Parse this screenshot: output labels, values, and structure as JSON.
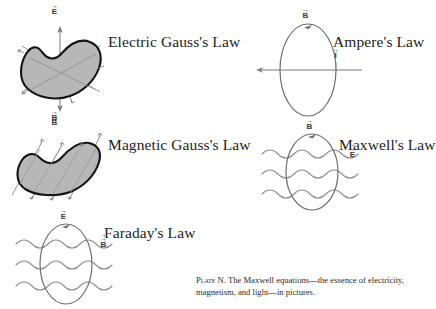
{
  "plate": {
    "caption_label": "Plate N.",
    "caption_text": " The Maxwell equations—the essence of electricity, magnetism, and light—in pictures."
  },
  "figures": [
    {
      "id": "electric-gauss",
      "title": "Electric Gauss's Law",
      "labels": [
        {
          "symbol": "E",
          "accent": "vector",
          "position": "top"
        },
        {
          "symbol": "B",
          "accent": "vector",
          "position": "bottom"
        }
      ],
      "shape": "closed-blob-shaded",
      "field": "outward-radial-flux-arrows"
    },
    {
      "id": "ampere",
      "title": "Ampere's Law",
      "labels": [
        {
          "symbol": "B",
          "accent": "vector",
          "position": "top"
        },
        {
          "symbol": "I",
          "accent": "vector",
          "position": "right"
        }
      ],
      "shape": "closed-loop-ellipse",
      "field": "horizontal-current-arrow"
    },
    {
      "id": "magnetic-gauss",
      "title": "Magnetic Gauss's Law",
      "labels": [
        {
          "symbol": "B",
          "accent": "vector",
          "position": "top"
        }
      ],
      "shape": "closed-blob-shaded",
      "field": "uniform-parallel-flux-lines"
    },
    {
      "id": "maxwell",
      "title": "Maxwell's Law",
      "labels": [
        {
          "symbol": "B",
          "accent": "vector",
          "position": "top"
        },
        {
          "symbol": "E",
          "accent": "dot-vector",
          "position": "right"
        }
      ],
      "shape": "closed-loop-ellipse",
      "field": "three-wavy-horizontal-lines"
    },
    {
      "id": "faraday",
      "title": "Faraday's Law",
      "labels": [
        {
          "symbol": "E",
          "accent": "vector",
          "position": "top"
        },
        {
          "symbol": "B",
          "accent": "dot-vector",
          "position": "right"
        }
      ],
      "shape": "closed-loop-ellipse",
      "field": "three-wavy-horizontal-lines"
    }
  ],
  "colors": {
    "ink": "#1a1a1a",
    "blob_fill": "#b5b5b5",
    "blob_stroke": "#141414",
    "field_line": "#777777",
    "loop_stroke": "#6e6e6e"
  }
}
